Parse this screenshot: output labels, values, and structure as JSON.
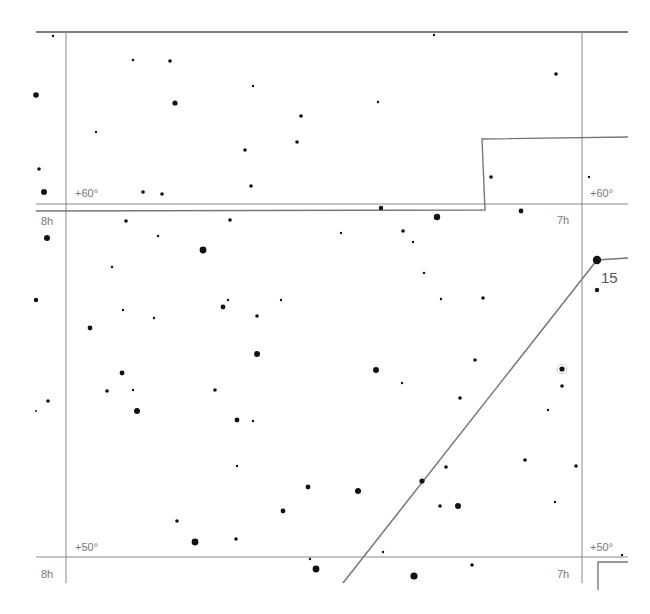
{
  "chart_data": {
    "type": "scatter",
    "title": "",
    "grid_lines": {
      "ra_lines": [
        {
          "label": "8h",
          "x": 66
        },
        {
          "label": "7h",
          "x": 582
        }
      ],
      "dec_lines": [
        {
          "label": "+60°",
          "y": 204
        },
        {
          "label": "+50°",
          "y": 557
        }
      ]
    },
    "labels": {
      "ra_8h_top": "8h",
      "ra_7h_top": "7h",
      "ra_8h_bottom": "8h",
      "ra_7h_bottom": "7h",
      "dec_60_left": "+60°",
      "dec_60_right": "+60°",
      "dec_50_left": "+50°",
      "dec_50_right": "+50°",
      "star_label_15": "15"
    },
    "colors": {
      "grid": "#888888",
      "boundary": "#777777",
      "star": "#111111",
      "constellation_line": "#777777"
    },
    "stars": [
      {
        "x": 53,
        "y": 36,
        "r": 1.2
      },
      {
        "x": 133,
        "y": 60,
        "r": 1.3
      },
      {
        "x": 170,
        "y": 61,
        "r": 1.8
      },
      {
        "x": 36,
        "y": 95,
        "r": 2.8
      },
      {
        "x": 175,
        "y": 103,
        "r": 2.6
      },
      {
        "x": 253,
        "y": 86,
        "r": 1.2
      },
      {
        "x": 301,
        "y": 116,
        "r": 1.8
      },
      {
        "x": 96,
        "y": 132,
        "r": 1.2
      },
      {
        "x": 245,
        "y": 150,
        "r": 1.8
      },
      {
        "x": 297,
        "y": 142,
        "r": 1.8
      },
      {
        "x": 39,
        "y": 169,
        "r": 1.8
      },
      {
        "x": 44,
        "y": 192,
        "r": 3.0
      },
      {
        "x": 143,
        "y": 192,
        "r": 1.8
      },
      {
        "x": 162,
        "y": 194,
        "r": 1.8
      },
      {
        "x": 251,
        "y": 186,
        "r": 1.8
      },
      {
        "x": 434,
        "y": 35,
        "r": 1.2
      },
      {
        "x": 556,
        "y": 74,
        "r": 1.8
      },
      {
        "x": 378,
        "y": 102,
        "r": 1.2
      },
      {
        "x": 491,
        "y": 177,
        "r": 1.8
      },
      {
        "x": 589,
        "y": 177,
        "r": 1.2
      },
      {
        "x": 381,
        "y": 208,
        "r": 2.2
      },
      {
        "x": 437,
        "y": 217,
        "r": 3.2
      },
      {
        "x": 521,
        "y": 211,
        "r": 2.4
      },
      {
        "x": 47,
        "y": 238,
        "r": 3.0
      },
      {
        "x": 126,
        "y": 221,
        "r": 1.8
      },
      {
        "x": 230,
        "y": 220,
        "r": 1.8
      },
      {
        "x": 158,
        "y": 236,
        "r": 1.2
      },
      {
        "x": 203,
        "y": 250,
        "r": 3.4
      },
      {
        "x": 341,
        "y": 233,
        "r": 1.2
      },
      {
        "x": 403,
        "y": 231,
        "r": 1.8
      },
      {
        "x": 413,
        "y": 242,
        "r": 1.2
      },
      {
        "x": 112,
        "y": 267,
        "r": 1.2
      },
      {
        "x": 424,
        "y": 273,
        "r": 1.2
      },
      {
        "x": 36,
        "y": 300,
        "r": 2.2
      },
      {
        "x": 123,
        "y": 310,
        "r": 1.2
      },
      {
        "x": 154,
        "y": 318,
        "r": 1.2
      },
      {
        "x": 228,
        "y": 300,
        "r": 1.2
      },
      {
        "x": 223,
        "y": 307,
        "r": 2.4
      },
      {
        "x": 257,
        "y": 316,
        "r": 1.8
      },
      {
        "x": 281,
        "y": 300,
        "r": 1.2
      },
      {
        "x": 441,
        "y": 299,
        "r": 1.2
      },
      {
        "x": 483,
        "y": 298,
        "r": 1.8
      },
      {
        "x": 90,
        "y": 328,
        "r": 2.4
      },
      {
        "x": 257,
        "y": 354,
        "r": 3.0
      },
      {
        "x": 376,
        "y": 370,
        "r": 3.0
      },
      {
        "x": 475,
        "y": 360,
        "r": 1.8
      },
      {
        "x": 402,
        "y": 383,
        "r": 1.2
      },
      {
        "x": 122,
        "y": 373,
        "r": 2.4
      },
      {
        "x": 107,
        "y": 391,
        "r": 1.8
      },
      {
        "x": 133,
        "y": 390,
        "r": 1.2
      },
      {
        "x": 215,
        "y": 390,
        "r": 1.8
      },
      {
        "x": 48,
        "y": 401,
        "r": 1.8
      },
      {
        "x": 36,
        "y": 411,
        "r": 1.0
      },
      {
        "x": 137,
        "y": 411,
        "r": 3.0
      },
      {
        "x": 237,
        "y": 420,
        "r": 2.4
      },
      {
        "x": 253,
        "y": 421,
        "r": 1.2
      },
      {
        "x": 460,
        "y": 398,
        "r": 1.8
      },
      {
        "x": 548,
        "y": 410,
        "r": 1.2
      },
      {
        "x": 562,
        "y": 369,
        "r": 2.6,
        "ring": true
      },
      {
        "x": 562,
        "y": 386,
        "r": 1.8
      },
      {
        "x": 597,
        "y": 290,
        "r": 2.2
      },
      {
        "x": 237,
        "y": 466,
        "r": 1.2
      },
      {
        "x": 446,
        "y": 467,
        "r": 1.8
      },
      {
        "x": 525,
        "y": 460,
        "r": 1.8
      },
      {
        "x": 576,
        "y": 466,
        "r": 1.8
      },
      {
        "x": 308,
        "y": 487,
        "r": 2.4
      },
      {
        "x": 358,
        "y": 491,
        "r": 3.0
      },
      {
        "x": 422,
        "y": 481,
        "r": 2.6
      },
      {
        "x": 283,
        "y": 511,
        "r": 2.4
      },
      {
        "x": 440,
        "y": 506,
        "r": 1.8
      },
      {
        "x": 458,
        "y": 506,
        "r": 3.0
      },
      {
        "x": 555,
        "y": 502,
        "r": 1.2
      },
      {
        "x": 177,
        "y": 521,
        "r": 1.8
      },
      {
        "x": 195,
        "y": 542,
        "r": 3.4
      },
      {
        "x": 236,
        "y": 539,
        "r": 1.8
      },
      {
        "x": 310,
        "y": 559,
        "r": 1.2
      },
      {
        "x": 316,
        "y": 569,
        "r": 3.4
      },
      {
        "x": 383,
        "y": 552,
        "r": 1.2
      },
      {
        "x": 414,
        "y": 576,
        "r": 3.6
      },
      {
        "x": 472,
        "y": 565,
        "r": 1.8
      },
      {
        "x": 622,
        "y": 555,
        "r": 1.2
      },
      {
        "x": 597,
        "y": 260,
        "r": 4.2
      }
    ],
    "boundary_paths": [
      "M36,211 L485,210 L482,139 L628,137",
      "M598,590 L598,562 L628,562"
    ],
    "constellation_lines": [
      "M343,583 L597,260 L628,258"
    ]
  }
}
